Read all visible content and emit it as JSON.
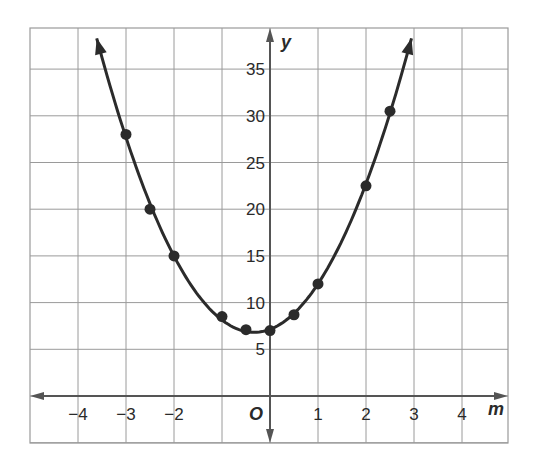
{
  "chart_data": {
    "type": "line",
    "title": "",
    "xlabel": "m",
    "ylabel": "y",
    "origin_label": "O",
    "xlim": [
      -5,
      5
    ],
    "ylim": [
      -1,
      39
    ],
    "grid": true,
    "x_ticks": [
      -4,
      -3,
      -2,
      1,
      2,
      3,
      4
    ],
    "x_tick_labels": [
      "−4",
      "−3",
      "−2",
      "1",
      "2",
      "3",
      "4"
    ],
    "y_ticks": [
      5,
      10,
      15,
      20,
      25,
      30,
      35
    ],
    "y_tick_labels": [
      "5",
      "10",
      "15",
      "20",
      "25",
      "30",
      "35"
    ],
    "points": [
      {
        "x": -3,
        "y": 28
      },
      {
        "x": -2.5,
        "y": 20
      },
      {
        "x": -2,
        "y": 15
      },
      {
        "x": -1,
        "y": 8.5
      },
      {
        "x": -0.5,
        "y": 7.1
      },
      {
        "x": 0,
        "y": 7
      },
      {
        "x": 0.5,
        "y": 8.7
      },
      {
        "x": 1,
        "y": 12
      },
      {
        "x": 2,
        "y": 22.5
      },
      {
        "x": 2.5,
        "y": 30.5
      }
    ],
    "curve": "parabola opening upward with arrows at both ends",
    "colors": {
      "curve": "#2b2b2b",
      "grid": "#9a9a9a",
      "axis": "#555555"
    }
  }
}
